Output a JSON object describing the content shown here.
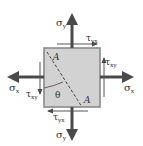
{
  "diagram": {
    "labels": {
      "sigma_y_top": "σ",
      "sigma_y_top_sub": "y",
      "sigma_y_bottom": "σ",
      "sigma_y_bottom_sub": "y",
      "sigma_x_left": "σ",
      "sigma_x_left_sub": "x",
      "sigma_x_right": "σ",
      "sigma_x_right_sub": "x",
      "tau_yx_top": "τ",
      "tau_yx_top_sub": "yx",
      "tau_yx_bottom": "τ",
      "tau_yx_bottom_sub": "yx",
      "tau_xy_right": "τ",
      "tau_xy_right_sub": "xy",
      "tau_xy_left": "τ",
      "tau_xy_left_sub": "xy",
      "plane_label_top": "A",
      "plane_label_bottom": "A",
      "angle": "θ"
    },
    "colors": {
      "element_fill": "#d2d2d2",
      "element_border": "#8a8a8a",
      "arrow": "#4a4a4a",
      "text": "#333333"
    }
  }
}
